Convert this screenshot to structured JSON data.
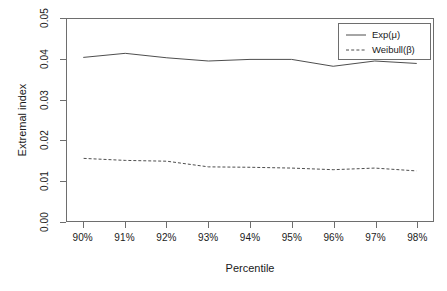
{
  "chart_data": {
    "type": "line",
    "title": "",
    "xlabel": "Percentile",
    "ylabel": "Extremal index",
    "x": [
      90,
      91,
      92,
      93,
      94,
      95,
      96,
      97,
      98
    ],
    "categories": [
      "90%",
      "91%",
      "92%",
      "93%",
      "94%",
      "95%",
      "96%",
      "97%",
      "98%"
    ],
    "xlim": [
      89.6,
      98.4
    ],
    "ylim": [
      0.0,
      0.05
    ],
    "yticks": [
      0.0,
      0.01,
      0.02,
      0.03,
      0.04,
      0.05
    ],
    "ytick_labels": [
      "0.00",
      "0.01",
      "0.02",
      "0.03",
      "0.04",
      "0.05"
    ],
    "grid": false,
    "legend_position": "top-right",
    "series": [
      {
        "name": "Exp(μ)",
        "style": "solid",
        "color": "#4d4d4d",
        "values": [
          0.0405,
          0.0415,
          0.0404,
          0.0396,
          0.04,
          0.04,
          0.0383,
          0.0396,
          0.039
        ]
      },
      {
        "name": "Weibull(β)",
        "style": "dashed",
        "color": "#4d4d4d",
        "values": [
          0.0155,
          0.015,
          0.0148,
          0.0134,
          0.0133,
          0.0131,
          0.0127,
          0.0131,
          0.0124
        ]
      }
    ]
  },
  "axes": {
    "y_title": "Extremal index",
    "x_title": "Percentile"
  },
  "legend": {
    "entries": [
      {
        "label": "Exp(μ)",
        "style": "solid"
      },
      {
        "label": "Weibull(β)",
        "style": "dashed"
      }
    ]
  },
  "colors": {
    "axis": "#6e6e6e",
    "line": "#4d4d4d",
    "text": "#1a1a1a",
    "background": "#ffffff"
  }
}
